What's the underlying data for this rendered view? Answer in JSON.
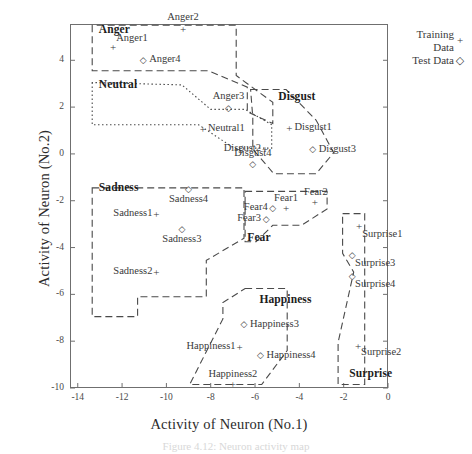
{
  "axes": {
    "xlabel": "Activity of Neuron (No.1)",
    "ylabel": "Activity of Neuron (No.2)",
    "xticks": [
      "-14",
      "-12",
      "-10",
      "-8",
      "-6",
      "-4",
      "-2",
      "0"
    ],
    "yticks": [
      "4",
      "2",
      "0",
      "-2",
      "-4",
      "-6",
      "-8",
      "-10"
    ],
    "xlim": [
      -14.35,
      0.0
    ],
    "ylim": [
      -10.0,
      5.55
    ]
  },
  "legend": {
    "training_label_line1": "Training",
    "training_label_line2": "Data",
    "training_marker": "plus-marker",
    "training_marker_glyph": "+",
    "test_label": "Test Data",
    "test_marker": "diamond-marker",
    "test_marker_glyph": "◇"
  },
  "caption": "Figure 4.12: Neuron activity map",
  "chart_data": {
    "type": "scatter",
    "title": "",
    "xlabel": "Activity of Neuron (No.1)",
    "ylabel": "Activity of Neuron (No.2)",
    "xlim": [
      -14.35,
      0.0
    ],
    "ylim": [
      -10.0,
      5.55
    ],
    "grid": false,
    "legend_position": "outside-top-right",
    "series": [
      {
        "name": "Training Data",
        "marker": "+",
        "points": [
          {
            "label": "Anger1",
            "x": -12.4,
            "y": 4.55
          },
          {
            "label": "Anger2",
            "x": -9.25,
            "y": 5.35
          },
          {
            "label": "Neutral1",
            "x": -8.35,
            "y": 1.05
          },
          {
            "label": "Disgust1",
            "x": -4.45,
            "y": 1.1
          },
          {
            "label": "Disgust2",
            "x": -5.55,
            "y": 0.22
          },
          {
            "label": "Sadness1",
            "x": -10.45,
            "y": -2.55
          },
          {
            "label": "Sadness2",
            "x": -10.45,
            "y": -5.05
          },
          {
            "label": "Fear1",
            "x": -4.6,
            "y": -2.3
          },
          {
            "label": "Fear2",
            "x": -3.3,
            "y": -2.05
          },
          {
            "label": "Happiness1",
            "x": -6.7,
            "y": -8.25
          },
          {
            "label": "Happiness2",
            "x": -7.0,
            "y": -9.85
          },
          {
            "label": "Surprise1",
            "x": -1.3,
            "y": -3.1
          },
          {
            "label": "Surprise2",
            "x": -1.35,
            "y": -8.2
          }
        ]
      },
      {
        "name": "Test Data",
        "marker": "◇",
        "points": [
          {
            "label": "Anger4",
            "x": -11.05,
            "y": 4.0
          },
          {
            "label": "Anger3",
            "x": -7.2,
            "y": 1.95
          },
          {
            "label": "Disgust3",
            "x": -3.4,
            "y": 0.22
          },
          {
            "label": "Disgust4",
            "x": -6.1,
            "y": -0.45
          },
          {
            "label": "Sadness4",
            "x": -9.0,
            "y": -1.5
          },
          {
            "label": "Sadness3",
            "x": -9.3,
            "y": -3.2
          },
          {
            "label": "Fear4",
            "x": -5.2,
            "y": -2.3
          },
          {
            "label": "Fear3",
            "x": -5.5,
            "y": -2.8
          },
          {
            "label": "Happiness3",
            "x": -6.5,
            "y": -7.25
          },
          {
            "label": "Happiness4",
            "x": -5.75,
            "y": -8.6
          },
          {
            "label": "Surprise3",
            "x": -1.62,
            "y": -4.3
          },
          {
            "label": "Surprise4",
            "x": -1.62,
            "y": -5.2
          }
        ]
      }
    ],
    "regions": [
      {
        "name": "Anger",
        "style": "dashed",
        "label_x": -13.05,
        "label_y": 5.3
      },
      {
        "name": "Neutral",
        "style": "dotted",
        "label_x": -13.05,
        "label_y": 2.95
      },
      {
        "name": "Disgust",
        "style": "dashed",
        "label_x": -4.95,
        "label_y": 2.45
      },
      {
        "name": "Sadness",
        "style": "dashed",
        "label_x": -13.05,
        "label_y": -1.45
      },
      {
        "name": "Fear",
        "style": "dashed",
        "label_x": -6.35,
        "label_y": -3.6
      },
      {
        "name": "Happiness",
        "style": "dashed",
        "label_x": -5.8,
        "label_y": -6.25
      },
      {
        "name": "Surprise",
        "style": "dashed",
        "label_x": -1.75,
        "label_y": -9.4
      }
    ]
  },
  "boundaries": {
    "anger": "M -13.35,5.50 L -13.35,3.55 L -8.10,3.55 L -6.35,2.85 L -6.35,1.80 L -5.20,1.30 L -5.20,2.20 L -6.85,3.35 L -6.85,5.50 Z",
    "neutral": "M -13.35,3.05 L -13.35,1.25 L -8.55,1.25 L -6.95,0.25 L -5.25,0.25 L -5.25,1.25 L -6.45,1.90 L -8.00,1.90 L -9.30,2.95 Z",
    "disgust": "M -6.20,2.75 L -4.60,2.75 L -3.25,1.45 L -2.45,0.05 L -3.25,-0.85 L -5.15,-0.85 L -6.10,0.20 L -6.10,1.55 Z",
    "sadness": "M -13.35,-1.45 L -6.50,-1.45 L -6.50,-3.60 L -8.20,-4.55 L -8.20,-6.10 L -11.30,-6.10 L -11.30,-6.95 L -13.35,-6.95 Z",
    "fear": "M -6.45,-1.60 L -2.75,-1.60 L -2.75,-2.35 L -3.90,-3.05 L -5.20,-3.05 L -5.95,-3.75 L -6.45,-3.75 Z",
    "happiness": "M -6.45,-5.75 L -4.55,-5.75 L -4.55,-8.40 L -5.70,-9.85 L -8.95,-9.85 L -7.45,-7.05 L -7.45,-6.35 Z",
    "surprise": "M -2.05,-2.55 L -1.05,-2.55 L -1.05,-9.85 L -2.25,-9.85 L -2.25,-8.05 L -1.55,-5.05 L -2.05,-4.25 Z"
  }
}
